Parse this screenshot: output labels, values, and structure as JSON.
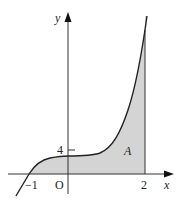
{
  "diagram": {
    "axes": {
      "x_label": "x",
      "y_label": "y",
      "origin_label": "O"
    },
    "ticks": {
      "x_neg": "−1",
      "x_pos": "2",
      "y_tick": "4"
    },
    "region_label": "A",
    "colors": {
      "shade": "#d4d4d4",
      "curve": "#222222",
      "axis": "#333333"
    }
  }
}
